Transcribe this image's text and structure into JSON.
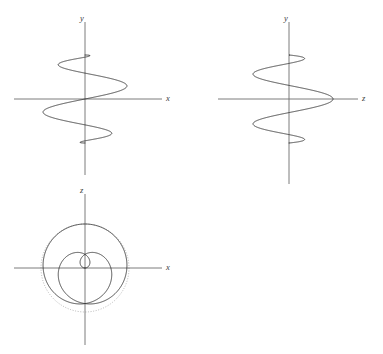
{
  "figure": {
    "background_color": "#ffffff",
    "axis_color": "#6e6e6e",
    "curve_color": "#2b2b2b",
    "guide_color": "#9a9a9a",
    "width": 383,
    "height": 354
  },
  "panels": [
    {
      "id": "top-left",
      "name": "xy-projection",
      "origin": [
        85,
        99
      ],
      "radius": 44,
      "vertical_axis": {
        "label": "y",
        "label_pos": [
          82,
          18
        ],
        "from": [
          85,
          22
        ],
        "to": [
          85,
          175
        ]
      },
      "horizontal_axis": {
        "label": "x",
        "label_pos": [
          168,
          98
        ],
        "from": [
          14,
          99
        ],
        "to": [
          162,
          99
        ]
      },
      "guide_circle": false,
      "projection": "xy"
    },
    {
      "id": "top-right",
      "name": "zy-projection",
      "origin": [
        289,
        99
      ],
      "radius": 44,
      "vertical_axis": {
        "label": "y",
        "label_pos": [
          285,
          18
        ],
        "from": [
          289,
          22
        ],
        "to": [
          289,
          178
        ]
      },
      "horizontal_axis": {
        "label": "z",
        "label_pos": [
          364,
          98
        ],
        "from": [
          218,
          99
        ],
        "to": [
          358,
          99
        ]
      },
      "guide_circle": false,
      "projection": "zy"
    },
    {
      "id": "bottom-left",
      "name": "xz-projection",
      "origin": [
        85,
        268
      ],
      "radius": 44,
      "vertical_axis": {
        "label": "z",
        "label_pos": [
          82,
          190
        ],
        "from": [
          85,
          194
        ],
        "to": [
          85,
          345
        ]
      },
      "horizontal_axis": {
        "label": "x",
        "label_pos": [
          168,
          267
        ],
        "from": [
          14,
          268
        ],
        "to": [
          162,
          268
        ]
      },
      "guide_circle": true,
      "projection": "xz"
    }
  ],
  "chart_data": {
    "type": "line",
    "title": "",
    "parametric_curve": {
      "name": "spherical-spiral",
      "equations": {
        "x": "R * sin(theta) * cos(n*theta)",
        "y": "R * cos(theta)",
        "z": "R * sin(theta) * sin(n*theta)"
      },
      "radius": 1.0,
      "windings": 5,
      "theta_range": [
        0,
        3.14159265
      ],
      "samples": 1400
    },
    "panels": [
      {
        "label": "xy",
        "xlabel": "x",
        "ylabel": "y",
        "xlim": [
          -1,
          1
        ],
        "ylim": [
          -1,
          1
        ],
        "grid": false
      },
      {
        "label": "zy",
        "xlabel": "z",
        "ylabel": "y",
        "xlim": [
          -1,
          1
        ],
        "ylim": [
          -1,
          1
        ],
        "grid": false
      },
      {
        "label": "xz",
        "xlabel": "x",
        "ylabel": "z",
        "xlim": [
          -1,
          1
        ],
        "ylim": [
          -1,
          1
        ],
        "grid": false
      }
    ],
    "legend": [],
    "annotations": []
  },
  "labels": {
    "y_top_left": "y",
    "x_top_left": "x",
    "y_top_right": "y",
    "z_top_right": "z",
    "z_bottom_left": "z",
    "x_bottom_left": "x"
  }
}
